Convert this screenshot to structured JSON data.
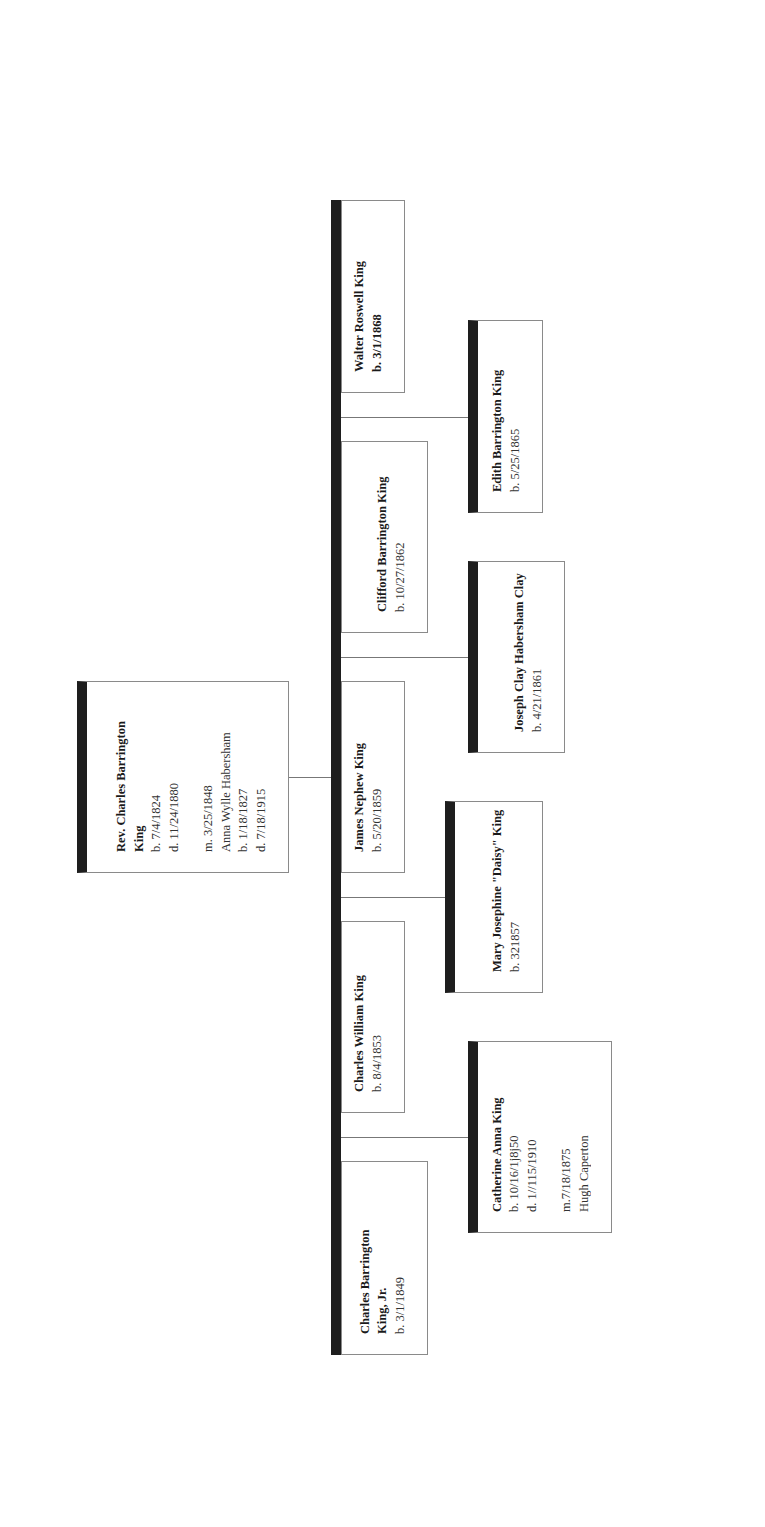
{
  "diagram": {
    "type": "family-tree",
    "orientation": "rotated-90-ccw"
  },
  "parent": {
    "name": "Rev. Charles Barrington King",
    "lines": [
      "b. 7/4/1824",
      "d. 11/24/1880"
    ],
    "marriage": "m. 3/25/1848",
    "spouse": {
      "name": "Anna Wylle Habersham",
      "lines": [
        "b. 1/18/1827",
        "d. 7/18/1915"
      ]
    }
  },
  "children": [
    {
      "name": "Walter Roswell King",
      "lines": [
        "b. 3/1/1868"
      ],
      "bold_dates": true
    },
    {
      "name": "Edith Barrington King",
      "lines": [
        "b. 5/25/1865"
      ]
    },
    {
      "name": "Clifford Barrington King",
      "lines": [
        "b. 10/27/1862"
      ]
    },
    {
      "name": "Joseph Clay Habersham Clay",
      "lines": [
        "b. 4/21/1861"
      ]
    },
    {
      "name": "James Nephew King",
      "lines": [
        "b. 5/20/1859"
      ]
    },
    {
      "name": "Mary Josephine \"Daisy\" King",
      "lines": [
        "b. 321857"
      ]
    },
    {
      "name": "Charles William King",
      "lines": [
        "b. 8/4/1853"
      ]
    },
    {
      "name": "Catherine Anna King",
      "lines": [
        "b. 10/16/1j8j50",
        "d. 1//115/1910"
      ],
      "marriage": "m.7/18/1875",
      "spouse": "Hugh Caperton"
    },
    {
      "name": "Charles Barrington King, Jr.",
      "lines": [
        "b. 3/1/1849"
      ]
    }
  ],
  "colors": {
    "bar": "#1e1e1e",
    "border": "#8a8a8a",
    "connector": "#777777",
    "background": "#ffffff"
  }
}
